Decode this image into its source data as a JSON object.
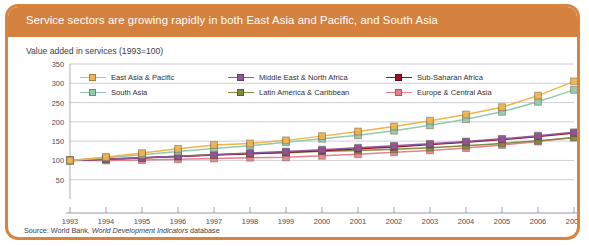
{
  "panel": {
    "title": "Service sectors are growing rapidly in both East Asia and Pacific, and South Asia",
    "subtitle": "Value added in services (1993=100)",
    "source_prefix": "Source: World Bank, ",
    "source_italic": "World Development Indicators",
    "source_suffix": " database",
    "accent_color": "#d4813f",
    "border_color": "#d9833f",
    "background_color": "#ffffff"
  },
  "chart_data": {
    "type": "line",
    "title": "Service sectors are growing rapidly in both East Asia and Pacific, and South Asia",
    "subtitle": "Value added in services (1993=100)",
    "xlabel": "",
    "ylabel": "",
    "x": [
      1993,
      1994,
      1995,
      1996,
      1997,
      1998,
      1999,
      2000,
      2001,
      2002,
      2003,
      2004,
      2005,
      2006,
      2007
    ],
    "categories": [
      "1993",
      "1994",
      "1995",
      "1996",
      "1997",
      "1998",
      "1999",
      "2000",
      "2001",
      "2002",
      "2003",
      "2004",
      "2005",
      "2006",
      "2007"
    ],
    "xlim": [
      1993,
      2007
    ],
    "ylim": [
      0,
      350
    ],
    "yticks": [
      50,
      100,
      150,
      200,
      250,
      300,
      350
    ],
    "xticks": [
      "1993",
      "1994",
      "1995",
      "1996",
      "1997",
      "1998",
      "1999",
      "2000",
      "2001",
      "2002",
      "2003",
      "2004",
      "2005",
      "2006",
      "2007"
    ],
    "grid": "horizontal",
    "legend_position": "top",
    "legend_columns": 3,
    "marker": "square",
    "series": [
      {
        "name": "East Asia & Pacific",
        "color": "#f0b44a",
        "values": [
          100,
          109,
          119,
          130,
          140,
          144,
          152,
          163,
          175,
          188,
          203,
          219,
          238,
          268,
          305
        ]
      },
      {
        "name": "South Asia",
        "color": "#93c9ad",
        "values": [
          100,
          107,
          115,
          123,
          131,
          138,
          147,
          156,
          165,
          177,
          191,
          207,
          226,
          252,
          283
        ]
      },
      {
        "name": "Middle East & North Africa",
        "color": "#8d5a9e",
        "values": [
          100,
          103,
          107,
          111,
          115,
          119,
          123,
          128,
          133,
          138,
          143,
          149,
          156,
          164,
          173
        ]
      },
      {
        "name": "Latin America & Caribbean",
        "color": "#7d8c3e",
        "values": [
          100,
          104,
          107,
          111,
          115,
          118,
          120,
          124,
          126,
          129,
          133,
          138,
          144,
          151,
          159
        ]
      },
      {
        "name": "Sub-Saharan Africa",
        "color": "#9e0d26",
        "values": [
          100,
          103,
          106,
          110,
          114,
          117,
          121,
          125,
          130,
          135,
          141,
          147,
          154,
          162,
          171
        ]
      },
      {
        "name": "Europe & Central Asia",
        "color": "#e8808c",
        "values": [
          100,
          100,
          101,
          103,
          105,
          107,
          108,
          112,
          116,
          121,
          126,
          132,
          140,
          149,
          160
        ]
      }
    ]
  }
}
